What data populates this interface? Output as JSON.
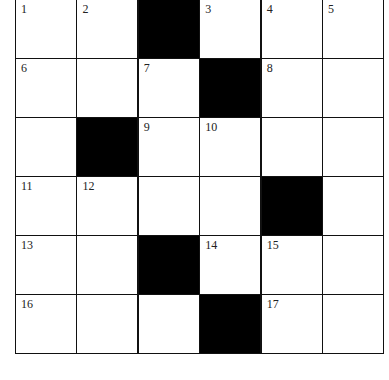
{
  "puzzle": {
    "type": "crossword",
    "rows": 6,
    "cols": 6,
    "cells": [
      [
        {
          "n": "1"
        },
        {
          "n": "2"
        },
        {
          "black": true
        },
        {
          "n": "3"
        },
        {
          "n": "4"
        },
        {
          "n": "5"
        }
      ],
      [
        {
          "n": "6"
        },
        {
          "n": ""
        },
        {
          "n": "7"
        },
        {
          "black": true
        },
        {
          "n": "8"
        },
        {
          "n": ""
        }
      ],
      [
        {
          "n": ""
        },
        {
          "black": true
        },
        {
          "n": "9"
        },
        {
          "n": "10"
        },
        {
          "n": ""
        },
        {
          "n": ""
        }
      ],
      [
        {
          "n": "11"
        },
        {
          "n": "12"
        },
        {
          "n": ""
        },
        {
          "n": ""
        },
        {
          "black": true
        },
        {
          "n": ""
        }
      ],
      [
        {
          "n": "13"
        },
        {
          "n": ""
        },
        {
          "black": true
        },
        {
          "n": "14"
        },
        {
          "n": "15"
        },
        {
          "n": ""
        }
      ],
      [
        {
          "n": "16"
        },
        {
          "n": ""
        },
        {
          "n": ""
        },
        {
          "black": true
        },
        {
          "n": "17"
        },
        {
          "n": ""
        }
      ]
    ]
  }
}
